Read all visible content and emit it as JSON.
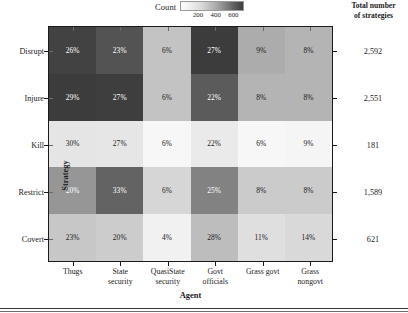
{
  "legend": {
    "title": "Count",
    "ticks": [
      "200",
      "400",
      "600"
    ],
    "tick_values": [
      200,
      400,
      600
    ],
    "vmin": 0,
    "vmax": 700,
    "gradient_light": "#ffffff",
    "gradient_dark": "#3c3c3c"
  },
  "right_header": "Total number\nof strategies",
  "axis_titles": {
    "x": "Agent",
    "y": "Strategy"
  },
  "chart_data": {
    "type": "heatmap",
    "title": "",
    "xlabel": "Agent",
    "ylabel": "Strategy",
    "grid": false,
    "legend_position": "top-center",
    "colorscale": "grayscale-light-to-dark",
    "categories_x": [
      "Thugs",
      "State\nsecurity",
      "QuasiState\nsecurity",
      "Govt\nofficials",
      "Grass govt",
      "Grass\nnongovt"
    ],
    "categories_y": [
      "Disrupt",
      "Injure",
      "Kill",
      "Restrict",
      "Covert"
    ],
    "cell_label_suffix": "%",
    "percent": [
      [
        26,
        23,
        6,
        27,
        9,
        8
      ],
      [
        29,
        27,
        6,
        22,
        8,
        8
      ],
      [
        30,
        27,
        6,
        22,
        6,
        9
      ],
      [
        20,
        33,
        6,
        25,
        8,
        8
      ],
      [
        23,
        20,
        4,
        28,
        11,
        14
      ]
    ],
    "counts": [
      [
        674,
        596,
        156,
        700,
        233,
        207
      ],
      [
        740,
        689,
        153,
        561,
        204,
        204
      ],
      [
        54,
        49,
        11,
        40,
        11,
        16
      ],
      [
        318,
        524,
        95,
        397,
        127,
        127
      ],
      [
        143,
        124,
        25,
        174,
        68,
        87
      ]
    ],
    "row_totals": [
      2592,
      2551,
      181,
      1589,
      621
    ],
    "row_totals_display": [
      "2,592",
      "2,551",
      "181",
      "1,589",
      "621"
    ]
  }
}
